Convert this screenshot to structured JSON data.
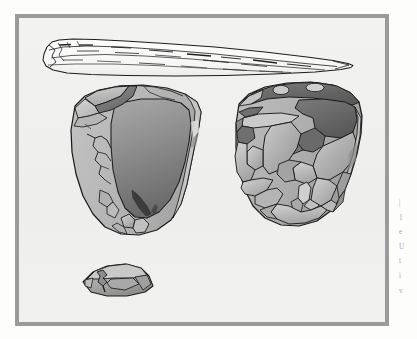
{
  "figure": {
    "name": "lithic-artifact-plate",
    "background_color": "#fdfdfc",
    "plate_background_color": "#f1f1ef",
    "frame_color": "#9b9b9b",
    "outline_color": "#1a1a1a"
  },
  "palette": {
    "cortex_light": "#b9b9b9",
    "cortex_mid": "#a8a8a8",
    "scar_light": "#c6c6c6",
    "scar_mid": "#9a9a9a",
    "scar_dark": "#6f6f6f",
    "scar_darkest": "#4d4d4d",
    "blade_fill": "#fbfbfa",
    "line": "#1c1c1c"
  },
  "artifacts": [
    {
      "id": "blade-point",
      "label": "elongated blade point",
      "view": "dorsal",
      "position": "top",
      "fill": "#fbfbfa",
      "orientation": "horizontal, tapering to the right"
    },
    {
      "id": "core-left",
      "label": "levallois core, ventral face",
      "view": "ventral",
      "position": "lower-left",
      "fill": "#b7b7b7",
      "feature": "single large gradient flake scar on right half"
    },
    {
      "id": "core-right",
      "label": "levallois core, dorsal face",
      "view": "dorsal",
      "position": "lower-right",
      "fill": "#b7b7b7",
      "feature": "multiple overlapping flake scars"
    },
    {
      "id": "flake-small",
      "label": "small flake in profile",
      "view": "profile",
      "position": "bottom-centre-left",
      "fill": "#b0b0b0"
    }
  ],
  "margin_caption": {
    "lines": [
      "|",
      "1",
      "e",
      "U",
      "t",
      "i",
      "v"
    ]
  }
}
